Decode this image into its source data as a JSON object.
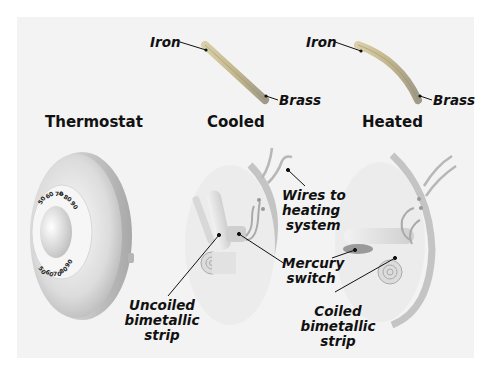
{
  "figure": {
    "titles": {
      "thermostat": "Thermostat",
      "cooled": "Cooled",
      "heated": "Heated"
    },
    "strip_labels": {
      "cooled_iron": "Iron",
      "cooled_brass": "Brass",
      "heated_iron": "Iron",
      "heated_brass": "Brass"
    },
    "callouts": {
      "wires_line1": "Wires to",
      "wires_line2": "heating",
      "wires_line3": "system",
      "mercury_line1": "Mercury",
      "mercury_line2": "switch",
      "uncoiled_line1": "Uncoiled",
      "uncoiled_line2": "bimetallic",
      "uncoiled_line3": "strip",
      "coiled_line1": "Coiled",
      "coiled_line2": "bimetallic",
      "coiled_line3": "strip"
    },
    "dial": {
      "top_numbers": [
        "50",
        "60",
        "70",
        "80",
        "90"
      ],
      "bottom_numbers": [
        "50",
        "60",
        "70",
        "80",
        "90"
      ]
    },
    "colors": {
      "panel_bg": "#f3f3f3",
      "metal_light": "#e6e6e6",
      "metal_dark": "#a9a9a9",
      "strip_tan": "#c9b98a",
      "leader_line": "#111111"
    }
  }
}
